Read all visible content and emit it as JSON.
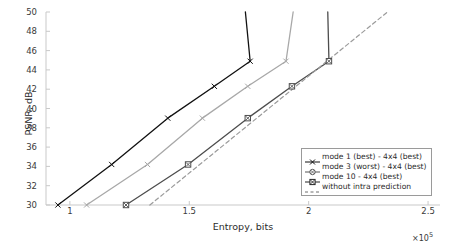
{
  "chart_data": {
    "type": "line",
    "title": "",
    "xlabel": "Entropy, bits",
    "ylabel": "PSNR, dB",
    "x_multiplier": "×10",
    "x_multiplier_exponent": "5",
    "xlim": [
      0.9,
      2.55
    ],
    "ylim": [
      30,
      50
    ],
    "xticks": [
      "1",
      "1.5",
      "2",
      "2.5"
    ],
    "xtick_values": [
      1,
      1.5,
      2,
      2.5
    ],
    "yticks": [
      "30",
      "32",
      "34",
      "36",
      "38",
      "40",
      "42",
      "44",
      "46",
      "48",
      "50"
    ],
    "ytick_values": [
      30,
      32,
      34,
      36,
      38,
      40,
      42,
      44,
      46,
      48,
      50
    ],
    "grid": false,
    "legend_position": "lower-right-inside",
    "series": [
      {
        "name": "mode 1 (best) - 4x4 (best)",
        "marker": "x",
        "linestyle": "solid",
        "color": "#111111",
        "x": [
          0.95,
          1.175,
          1.41,
          1.605,
          1.755,
          1.735
        ],
        "y": [
          30.0,
          34.2,
          39.0,
          42.3,
          44.9,
          50.0
        ],
        "points": [
          {
            "x": 0.95,
            "y": 30.0
          },
          {
            "x": 1.175,
            "y": 34.2
          },
          {
            "x": 1.41,
            "y": 39.0
          },
          {
            "x": 1.605,
            "y": 42.3
          },
          {
            "x": 1.755,
            "y": 44.9
          }
        ]
      },
      {
        "name": "mode 3 (worst) - 4x4 (best)",
        "marker": "x",
        "linestyle": "solid",
        "color": "#a8a8a8",
        "x": [
          1.07,
          1.325,
          1.555,
          1.745,
          1.905,
          1.935
        ],
        "y": [
          30.0,
          34.2,
          39.0,
          42.3,
          44.9,
          50.0
        ],
        "points": [
          {
            "x": 1.07,
            "y": 30.0
          },
          {
            "x": 1.325,
            "y": 34.2
          },
          {
            "x": 1.555,
            "y": 39.0
          },
          {
            "x": 1.745,
            "y": 42.3
          },
          {
            "x": 1.905,
            "y": 44.9
          }
        ]
      },
      {
        "name": "mode 10 - 4x4 (best)",
        "marker": "square",
        "linestyle": "solid",
        "color": "#4d4d4d",
        "x": [
          1.235,
          1.495,
          1.745,
          1.93,
          2.085,
          2.08
        ],
        "y": [
          30.0,
          34.2,
          39.0,
          42.3,
          44.9,
          50.0
        ],
        "points": [
          {
            "x": 1.235,
            "y": 30.0
          },
          {
            "x": 1.495,
            "y": 34.2
          },
          {
            "x": 1.745,
            "y": 39.0
          },
          {
            "x": 1.93,
            "y": 42.3
          },
          {
            "x": 2.085,
            "y": 44.9
          }
        ]
      },
      {
        "name": "without intra prediction",
        "marker": "none",
        "linestyle": "dashed",
        "color": "#9b9b9b",
        "x": [
          1.335,
          2.33
        ],
        "y": [
          30.0,
          50.0
        ],
        "points": [
          {
            "x": 1.335,
            "y": 30.0
          },
          {
            "x": 2.33,
            "y": 50.0
          }
        ]
      }
    ],
    "legend": [
      {
        "label": "mode 1 (best) - 4x4 (best)",
        "marker": "x",
        "linestyle": "solid",
        "color": "#111111"
      },
      {
        "label": "mode 3 (worst) - 4x4 (best)",
        "marker": "circle",
        "linestyle": "solid",
        "color": "#555555"
      },
      {
        "label": "mode 10 - 4x4 (best)",
        "marker": "square",
        "linestyle": "solid",
        "color": "#222222"
      },
      {
        "label": "without intra prediction",
        "marker": "none",
        "linestyle": "dashed",
        "color": "#6f6f6f"
      }
    ]
  },
  "axis": {
    "spine_color": "#c9c9c9",
    "tick_color": "#c9c9c9",
    "text_color": "#3a3a3a"
  }
}
